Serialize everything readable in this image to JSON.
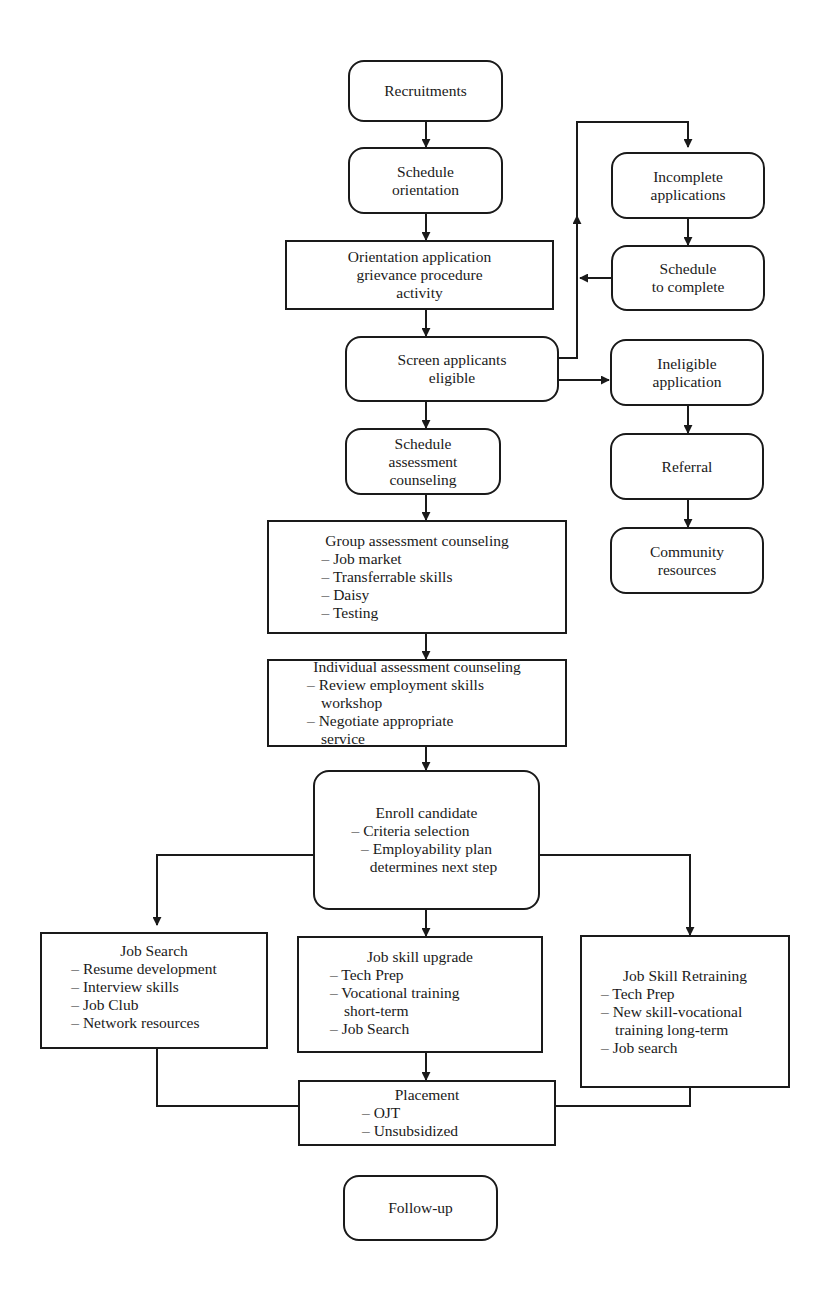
{
  "diagram": {
    "type": "flowchart",
    "nodes": {
      "recruitments": {
        "title": "Recruitments"
      },
      "schedule_orientation": {
        "lines": [
          "Schedule",
          "orientation"
        ]
      },
      "orientation_application": {
        "lines": [
          "Orientation application",
          "grievance procedure",
          "activity"
        ]
      },
      "screen_applicants": {
        "lines": [
          "Screen applicants",
          "eligible"
        ]
      },
      "incomplete_applications": {
        "lines": [
          "Incomplete",
          "applications"
        ]
      },
      "schedule_to_complete": {
        "lines": [
          "Schedule",
          "to complete"
        ]
      },
      "ineligible_application": {
        "lines": [
          "Ineligible",
          "application"
        ]
      },
      "referral": {
        "title": "Referral"
      },
      "community_resources": {
        "lines": [
          "Community",
          "resources"
        ]
      },
      "schedule_assessment": {
        "lines": [
          "Schedule",
          "assessment",
          "counseling"
        ]
      },
      "group_assessment": {
        "title": "Group assessment counseling",
        "items": [
          "Job market",
          "Transferrable skills",
          "Daisy",
          "Testing"
        ]
      },
      "individual_assessment": {
        "title": "Individual assessment counseling",
        "items": [
          "Review employment skills workshop",
          "Negotiate appropriate service"
        ]
      },
      "enroll_candidate": {
        "title": "Enroll candidate",
        "items": [
          "Criteria selection",
          "Employability plan determines next step"
        ]
      },
      "job_search": {
        "title": "Job Search",
        "items": [
          "Resume development",
          "Interview skills",
          "Job Club",
          "Network resources"
        ]
      },
      "job_skill_upgrade": {
        "title": "Job skill upgrade",
        "items": [
          "Tech Prep",
          "Vocational training short-term",
          "Job Search"
        ]
      },
      "job_skill_retraining": {
        "title": "Job Skill Retraining",
        "items": [
          "Tech Prep",
          "New skill-vocational training long-term",
          "Job search"
        ]
      },
      "placement": {
        "title": "Placement",
        "items": [
          "OJT",
          "Unsubsidized"
        ]
      },
      "follow_up": {
        "title": "Follow-up"
      }
    },
    "edges": [
      [
        "recruitments",
        "schedule_orientation"
      ],
      [
        "schedule_orientation",
        "orientation_application"
      ],
      [
        "orientation_application",
        "screen_applicants"
      ],
      [
        "screen_applicants",
        "incomplete_applications"
      ],
      [
        "incomplete_applications",
        "schedule_to_complete"
      ],
      [
        "schedule_to_complete",
        "screen_applicants"
      ],
      [
        "screen_applicants",
        "ineligible_application"
      ],
      [
        "ineligible_application",
        "referral"
      ],
      [
        "referral",
        "community_resources"
      ],
      [
        "screen_applicants",
        "schedule_assessment"
      ],
      [
        "schedule_assessment",
        "group_assessment"
      ],
      [
        "group_assessment",
        "individual_assessment"
      ],
      [
        "individual_assessment",
        "enroll_candidate"
      ],
      [
        "enroll_candidate",
        "job_search"
      ],
      [
        "enroll_candidate",
        "job_skill_upgrade"
      ],
      [
        "enroll_candidate",
        "job_skill_retraining"
      ],
      [
        "job_skill_upgrade",
        "placement"
      ],
      [
        "job_search",
        "placement"
      ],
      [
        "job_skill_retraining",
        "placement"
      ]
    ]
  }
}
